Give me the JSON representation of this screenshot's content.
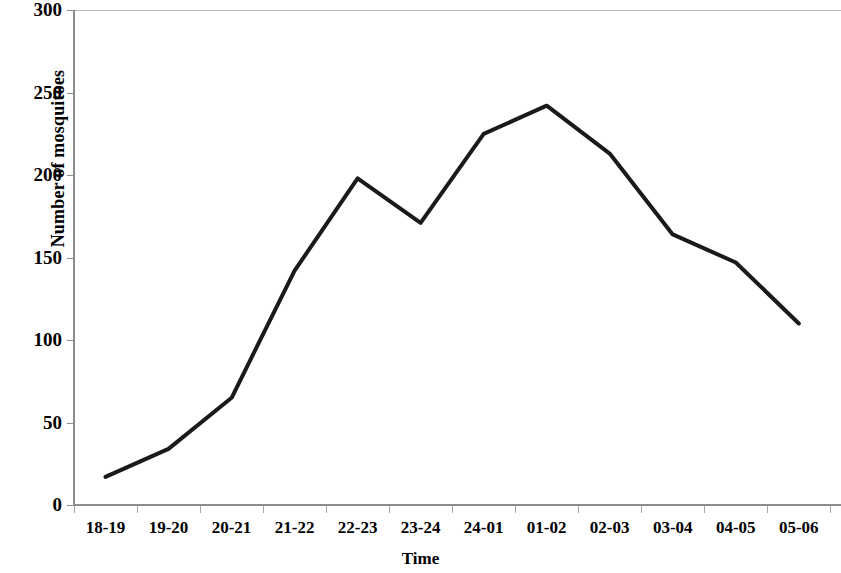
{
  "chart_data": {
    "type": "line",
    "title": "",
    "xlabel": "Time",
    "ylabel": "Number of mosquitoes",
    "categories": [
      "18-19",
      "19-20",
      "20-21",
      "21-22",
      "22-23",
      "23-24",
      "24-01",
      "01-02",
      "02-03",
      "03-04",
      "04-05",
      "05-06"
    ],
    "values": [
      17,
      34,
      65,
      142,
      198,
      171,
      225,
      242,
      213,
      164,
      147,
      110
    ],
    "series": [
      {
        "name": "Number of mosquitoes",
        "values": [
          17,
          34,
          65,
          142,
          198,
          171,
          225,
          242,
          213,
          164,
          147,
          110
        ]
      }
    ],
    "ylim": [
      0,
      300
    ],
    "yticks": [
      0,
      50,
      100,
      150,
      200,
      250,
      300
    ],
    "ytick_labels": [
      "0",
      "50",
      "100",
      "150",
      "200",
      "250",
      "300"
    ],
    "grid": false,
    "legend": "none",
    "line_color": "#1a1a1a",
    "line_width": 4,
    "markers": "none",
    "background_color": "#ffffff",
    "axis_color": "#8d8d8d"
  }
}
